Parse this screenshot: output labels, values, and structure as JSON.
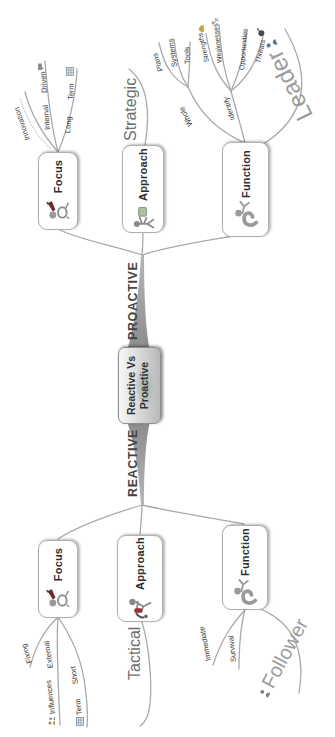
{
  "center": {
    "line1": "Reactive Vs",
    "line2": "Proactive"
  },
  "proactive": {
    "side_label": "PROACTIVE",
    "focus": {
      "label": "Focus",
      "innovation": "Innovation",
      "internal": "Internal",
      "driven": "Driven",
      "long": "Long",
      "term": "Term"
    },
    "approach": {
      "label": "Approach",
      "strategy": "Strategic"
    },
    "function": {
      "label": "Function",
      "whole": "Whole",
      "plans": "Plans",
      "systems": "Systems",
      "tools": "Tools",
      "identify": "Identify",
      "strengths": "Strengths",
      "weaknesses": "Weaknesses",
      "opportunities": "Opportunities",
      "threats": "Threats"
    },
    "callout": "Leader"
  },
  "reactive": {
    "side_label": "REACTIVE",
    "focus": {
      "label": "Focus",
      "fixing": "Fixing",
      "external": "External",
      "influences": "Influences",
      "short": "Short",
      "term": "Term"
    },
    "approach": {
      "label": "Approach",
      "strategy": "Tactical"
    },
    "function": {
      "label": "Function",
      "immediate": "Immediate",
      "survival": "Survival"
    },
    "callout": "Follower"
  },
  "colors": {
    "branch": "#a9a9a9",
    "trunk": "#9b9b9b",
    "node_border": "#b0b0b0",
    "text": "#2e2e2e",
    "muted": "#9c9c9c"
  }
}
